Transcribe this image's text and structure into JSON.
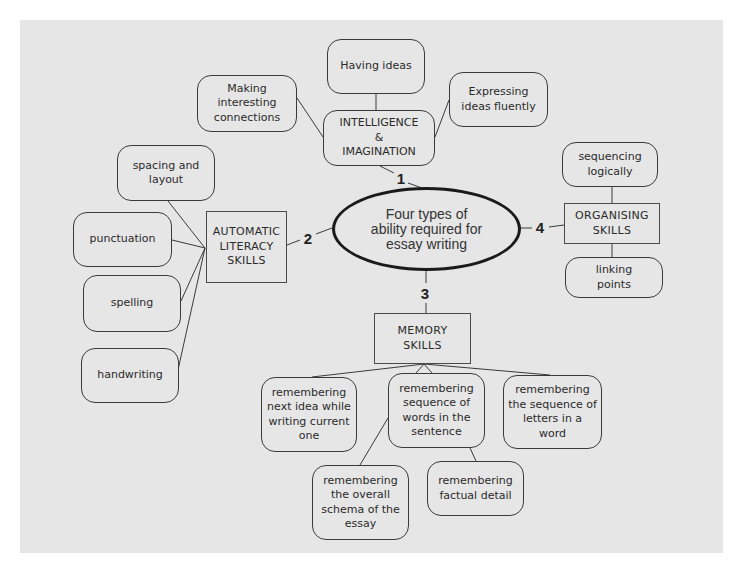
{
  "center": {
    "label": "Four types of\nability required for\nessay writing"
  },
  "branches": [
    {
      "number": "1",
      "label": "INTELLIGENCE\n&\nIMAGINATION",
      "children": [
        "Having ideas",
        "Making\ninteresting\nconnections",
        "Expressing\nideas fluently"
      ]
    },
    {
      "number": "2",
      "label": "AUTOMATIC\nLITERACY\nSKILLS",
      "children": [
        "spacing and\nlayout",
        "punctuation",
        "spelling",
        "handwriting"
      ]
    },
    {
      "number": "3",
      "label": "MEMORY\nSKILLS",
      "children": [
        "remembering\nnext idea while\nwriting current\none",
        "remembering\nsequence of\nwords in the\nsentence",
        "remembering\nthe sequence of\nletters in a\nword",
        "remembering\nthe overall\nschema of the\nessay",
        "remembering\nfactual detail"
      ]
    },
    {
      "number": "4",
      "label": "ORGANISING\nSKILLS",
      "children": [
        "sequencing\nlogically",
        "linking\npoints"
      ]
    }
  ],
  "colors": {
    "background": "#e6e6e6",
    "stroke": "#3a3a3a",
    "ellipse_stroke": "#1a1a1a"
  }
}
